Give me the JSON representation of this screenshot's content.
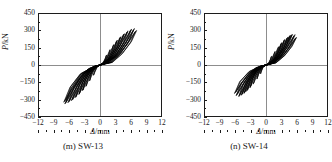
{
  "figure": {
    "background": "#ffffff",
    "axis_color": "#1c1c1c",
    "gridline_color": "#8d8d8d",
    "curve_color": "#000000"
  },
  "chart_data": [
    {
      "type": "line",
      "title": "(m) SW-13",
      "panel_label": "(m)",
      "specimen": "SW-13",
      "xlabel": "Δ/mm",
      "ylabel": "P/kN",
      "xlim": [
        -12,
        12
      ],
      "ylim": [
        -450,
        450
      ],
      "xticks": [
        -12,
        -9,
        -6,
        -3,
        0,
        3,
        6,
        9,
        12
      ],
      "xticklabels": [
        "−12",
        "−9",
        "−6",
        "−3",
        "0",
        "3",
        "6",
        "9",
        "12"
      ],
      "yticks": [
        -450,
        -300,
        -150,
        0,
        150,
        300,
        450
      ],
      "yticklabels": [
        "−450",
        "−300",
        "−150",
        "0",
        "150",
        "300",
        "450"
      ],
      "xminor_step": 1.5,
      "yminor_step": 75,
      "grid": false,
      "zero_axes": true,
      "description": "Pinched S-shaped hysteresis loops of lateral load versus displacement for shear wall specimen SW-13",
      "envelope_positive": [
        {
          "d": 0.0,
          "P": 0
        },
        {
          "d": 0.8,
          "P": 55
        },
        {
          "d": 1.6,
          "P": 110
        },
        {
          "d": 2.5,
          "P": 165
        },
        {
          "d": 3.4,
          "P": 215
        },
        {
          "d": 4.3,
          "P": 260
        },
        {
          "d": 5.2,
          "P": 295
        },
        {
          "d": 6.1,
          "P": 318
        },
        {
          "d": 6.8,
          "P": 322
        },
        {
          "d": 7.2,
          "P": 300
        }
      ],
      "envelope_negative": [
        {
          "d": 0.0,
          "P": 0
        },
        {
          "d": -0.8,
          "P": -58
        },
        {
          "d": -1.7,
          "P": -118
        },
        {
          "d": -2.6,
          "P": -175
        },
        {
          "d": -3.5,
          "P": -228
        },
        {
          "d": -4.4,
          "P": -272
        },
        {
          "d": -5.3,
          "P": -308
        },
        {
          "d": -6.2,
          "P": -335
        },
        {
          "d": -6.8,
          "P": -345
        },
        {
          "d": -7.1,
          "P": -330
        }
      ],
      "peak_positive": {
        "d": 6.8,
        "P": 322
      },
      "peak_negative": {
        "d": -6.8,
        "P": -345
      },
      "cycles": [
        {
          "d_max": 1.3,
          "P_max": 88,
          "d_min": -1.3,
          "P_min": -92
        },
        {
          "d_max": 2.0,
          "P_max": 135,
          "d_min": -2.1,
          "P_min": -142
        },
        {
          "d_max": 2.7,
          "P_max": 180,
          "d_min": -2.8,
          "P_min": -190
        },
        {
          "d_max": 3.4,
          "P_max": 218,
          "d_min": -3.5,
          "P_min": -230
        },
        {
          "d_max": 4.1,
          "P_max": 250,
          "d_min": -4.2,
          "P_min": -262
        },
        {
          "d_max": 4.8,
          "P_max": 278,
          "d_min": -4.9,
          "P_min": -290
        },
        {
          "d_max": 5.5,
          "P_max": 300,
          "d_min": -5.6,
          "P_min": -315
        },
        {
          "d_max": 6.2,
          "P_max": 316,
          "d_min": -6.3,
          "P_min": -336
        },
        {
          "d_max": 6.8,
          "P_max": 322,
          "d_min": -6.9,
          "P_min": -345
        },
        {
          "d_max": 7.2,
          "P_max": 305,
          "d_min": -7.1,
          "P_min": -330
        }
      ]
    },
    {
      "type": "line",
      "title": "(n) SW-14",
      "panel_label": "(n)",
      "specimen": "SW-14",
      "xlabel": "Δ/mm",
      "ylabel": "P/kN",
      "xlim": [
        -12,
        12
      ],
      "ylim": [
        -450,
        450
      ],
      "xticks": [
        -12,
        -9,
        -6,
        -3,
        0,
        3,
        6,
        9,
        12
      ],
      "xticklabels": [
        "−12",
        "−9",
        "−6",
        "−3",
        "0",
        "3",
        "6",
        "9",
        "12"
      ],
      "yticks": [
        -450,
        -300,
        -150,
        0,
        150,
        300,
        450
      ],
      "yticklabels": [
        "−450",
        "−300",
        "−150",
        "0",
        "150",
        "300",
        "450"
      ],
      "xminor_step": 1.5,
      "yminor_step": 75,
      "grid": false,
      "zero_axes": true,
      "description": "Pinched S-shaped hysteresis loops of lateral load versus displacement for shear wall specimen SW-14",
      "envelope_positive": [
        {
          "d": 0.0,
          "P": 0
        },
        {
          "d": 0.7,
          "P": 48
        },
        {
          "d": 1.5,
          "P": 100
        },
        {
          "d": 2.3,
          "P": 150
        },
        {
          "d": 3.1,
          "P": 195
        },
        {
          "d": 3.9,
          "P": 232
        },
        {
          "d": 4.6,
          "P": 258
        },
        {
          "d": 5.2,
          "P": 272
        },
        {
          "d": 5.7,
          "P": 268
        },
        {
          "d": 6.0,
          "P": 245
        }
      ],
      "envelope_negative": [
        {
          "d": 0.0,
          "P": 0
        },
        {
          "d": -0.7,
          "P": -50
        },
        {
          "d": -1.6,
          "P": -105
        },
        {
          "d": -2.4,
          "P": -155
        },
        {
          "d": -3.2,
          "P": -200
        },
        {
          "d": -4.0,
          "P": -238
        },
        {
          "d": -4.8,
          "P": -265
        },
        {
          "d": -5.4,
          "P": -280
        },
        {
          "d": -5.9,
          "P": -272
        },
        {
          "d": -6.2,
          "P": -250
        }
      ],
      "peak_positive": {
        "d": 5.2,
        "P": 272
      },
      "peak_negative": {
        "d": -5.4,
        "P": -280
      },
      "cycles": [
        {
          "d_max": 1.1,
          "P_max": 75,
          "d_min": -1.1,
          "P_min": -78
        },
        {
          "d_max": 1.8,
          "P_max": 120,
          "d_min": -1.8,
          "P_min": -125
        },
        {
          "d_max": 2.5,
          "P_max": 162,
          "d_min": -2.5,
          "P_min": -168
        },
        {
          "d_max": 3.1,
          "P_max": 196,
          "d_min": -3.2,
          "P_min": -202
        },
        {
          "d_max": 3.7,
          "P_max": 224,
          "d_min": -3.8,
          "P_min": -230
        },
        {
          "d_max": 4.3,
          "P_max": 246,
          "d_min": -4.4,
          "P_min": -252
        },
        {
          "d_max": 4.8,
          "P_max": 262,
          "d_min": -4.9,
          "P_min": -268
        },
        {
          "d_max": 5.2,
          "P_max": 272,
          "d_min": -5.4,
          "P_min": -280
        },
        {
          "d_max": 5.7,
          "P_max": 266,
          "d_min": -5.9,
          "P_min": -272
        },
        {
          "d_max": 6.0,
          "P_max": 245,
          "d_min": -6.2,
          "P_min": -250
        }
      ]
    }
  ]
}
